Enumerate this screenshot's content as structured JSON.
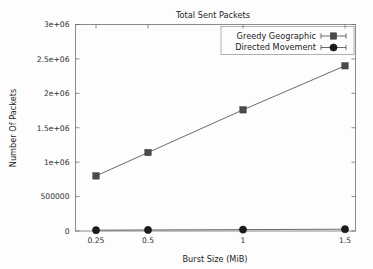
{
  "chart_data": {
    "type": "line",
    "title": "Total Sent Packets",
    "xlabel": "Burst Size (MiB)",
    "ylabel": "Number Of Packets",
    "x": [
      0.25,
      0.5,
      1,
      1.5
    ],
    "xtick_labels": [
      "0.25",
      "0.5",
      "1",
      "1.5"
    ],
    "xscale": "log",
    "ytick_labels": [
      "0",
      "500000",
      "1e+06",
      "1.5e+06",
      "2e+06",
      "2.5e+06",
      "3e+06"
    ],
    "ytick_values": [
      0,
      500000,
      1000000,
      1500000,
      2000000,
      2500000,
      3000000
    ],
    "ylim": [
      0,
      3000000
    ],
    "grid": false,
    "legend_position": "top-right",
    "series": [
      {
        "name": "Greedy Geographic",
        "marker": "square",
        "values": [
          800000,
          1140000,
          1760000,
          2400000
        ]
      },
      {
        "name": "Directed Movement",
        "marker": "circle",
        "values": [
          12000,
          15000,
          20000,
          26000
        ]
      }
    ]
  },
  "legend": {
    "entries": [
      {
        "label": "Greedy Geographic",
        "marker": "square"
      },
      {
        "label": "Directed Movement",
        "marker": "circle"
      }
    ]
  },
  "colors": {
    "background": "#fdfdfd",
    "axis": "#6f6f6f",
    "text": "#242424",
    "series_greedy": "#4a4a4a",
    "series_directed": "#1b1b1b"
  }
}
